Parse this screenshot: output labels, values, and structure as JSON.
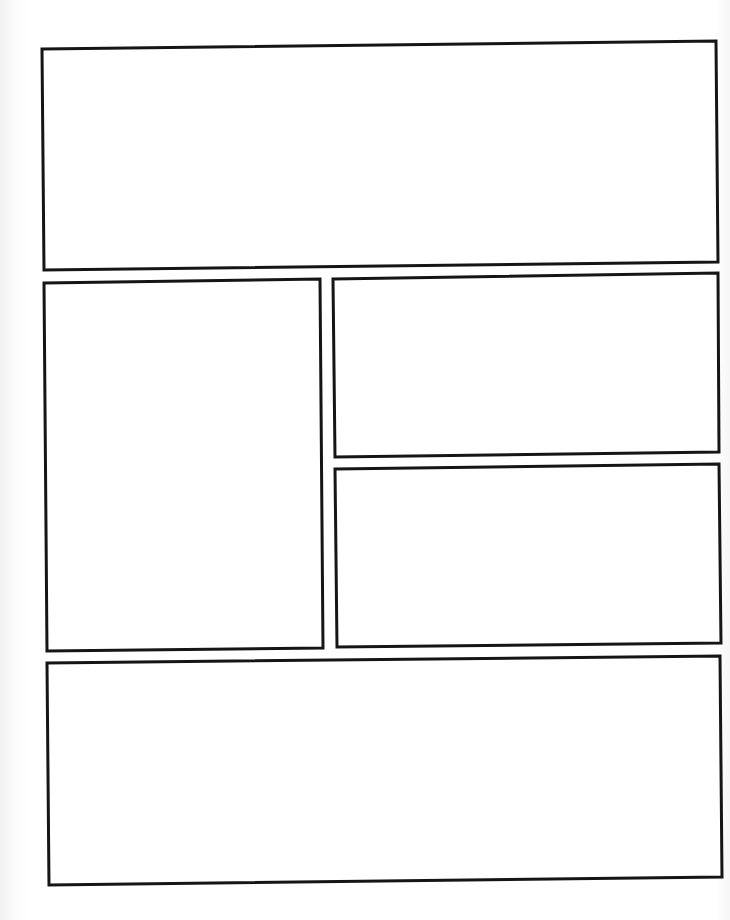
{
  "page": {
    "kind": "blank comic panel template",
    "width": 730,
    "height": 920,
    "background": "#ffffff",
    "border_color": "#151515"
  },
  "panels": [
    {
      "id": "panel-1",
      "points": "42,49 716,41 718,262 44,270"
    },
    {
      "id": "panel-2",
      "points": "44,283 320,279 323,648 47,651"
    },
    {
      "id": "panel-3",
      "points": "333,279 718,273 719,452 335,457"
    },
    {
      "id": "panel-4",
      "points": "335,469 719,464 721,643 337,647"
    },
    {
      "id": "panel-5",
      "points": "47,663 720,656 722,877 49,885"
    }
  ]
}
